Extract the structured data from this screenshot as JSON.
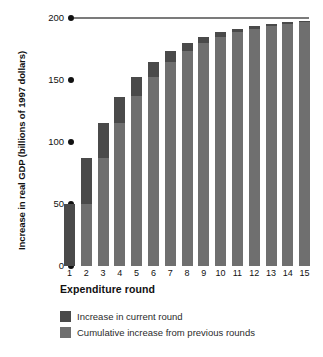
{
  "chart_data": {
    "type": "bar",
    "title": "",
    "subtitle": "",
    "xlabel": "Expenditure round",
    "ylabel": "Increase in real GDP (billions of 1997 dollars)",
    "categories": [
      "1",
      "2",
      "3",
      "4",
      "5",
      "6",
      "7",
      "8",
      "9",
      "10",
      "11",
      "12",
      "13",
      "14",
      "15"
    ],
    "ylim": [
      0,
      200
    ],
    "yticks": [
      0,
      50,
      100,
      150,
      200
    ],
    "ytick_labels": [
      "0",
      "50",
      "100",
      "150",
      "200"
    ],
    "grid": false,
    "stacked": true,
    "legend_position": "bottom-left",
    "series": [
      {
        "name": "Cumulative increase from previous rounds",
        "color": "#6f6f6f",
        "values": [
          0,
          50.0,
          87.5,
          115.6,
          136.7,
          152.6,
          164.4,
          173.3,
          180.0,
          185.0,
          188.7,
          191.5,
          193.6,
          195.2,
          196.4
        ]
      },
      {
        "name": "Increase in current round",
        "color": "#4a4a4a",
        "values": [
          50.0,
          37.5,
          28.1,
          21.1,
          15.9,
          11.8,
          8.9,
          6.7,
          5.0,
          3.7,
          2.8,
          2.1,
          1.6,
          1.2,
          0.9
        ]
      }
    ],
    "totals": [
      50.0,
      87.5,
      115.6,
      136.7,
      152.6,
      164.4,
      173.3,
      180.0,
      185.0,
      188.7,
      191.5,
      193.6,
      195.2,
      196.4,
      197.3
    ],
    "reference_line": {
      "value": 200,
      "label": "200",
      "color": "#7b7b7b"
    }
  },
  "axis": {
    "y_title": "Increase in real GDP (billions of 1997 dollars)",
    "x_title": "Expenditure round"
  },
  "legend": {
    "items": [
      {
        "label": "Increase in current round",
        "color": "#4a4a4a"
      },
      {
        "label": "Cumulative increase from previous rounds",
        "color": "#6f6f6f"
      }
    ]
  },
  "colors": {
    "current_round": "#4a4a4a",
    "cumulative": "#6f6f6f",
    "axis_text": "#111111",
    "reference_line": "#7b7b7b",
    "background": "#ffffff"
  }
}
